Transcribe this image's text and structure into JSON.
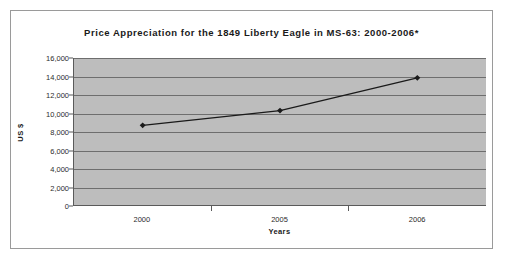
{
  "chart_data": {
    "type": "line",
    "title": "Price Appreciation for the 1849 Liberty Eagle in MS-63: 2000-2006*",
    "xlabel": "Years",
    "ylabel": "US $",
    "categories": [
      "2000",
      "2005",
      "2006"
    ],
    "values": [
      8700,
      10300,
      13850
    ],
    "series": [
      {
        "name": "US $",
        "values": [
          8700,
          10300,
          13850
        ]
      }
    ],
    "ylim": [
      0,
      16000
    ],
    "ytick_labels": [
      "16,000",
      "14,000",
      "12,000",
      "10,000",
      "8,000",
      "6,000",
      "4,000",
      "2,000",
      "0"
    ],
    "ytick_values": [
      16000,
      14000,
      12000,
      10000,
      8000,
      6000,
      4000,
      2000,
      0
    ],
    "grid": true,
    "legend": "none",
    "marker": "filled-diamond",
    "line_color": "#1a1a1a",
    "plot_bg_color": "#bdbdbd",
    "gridline_color": "#6e6e6e",
    "axis_color": "#5a5a5a",
    "frame_color": "#9a9a9a",
    "page_bg_color": "#ffffff"
  }
}
